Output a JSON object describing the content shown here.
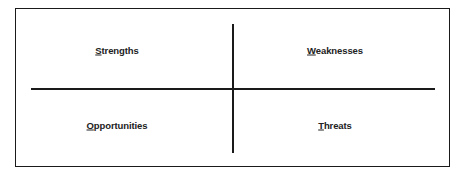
{
  "diagram": {
    "type": "SWOT matrix",
    "quadrants": [
      {
        "id": "strengths",
        "first": "S",
        "rest": "trengths",
        "label": "Strengths"
      },
      {
        "id": "weaknesses",
        "first": "W",
        "rest": "eaknesses",
        "label": "Weaknesses"
      },
      {
        "id": "opportunities",
        "first": "O",
        "rest": "pportunities",
        "label": "Opportunities"
      },
      {
        "id": "threats",
        "first": "T",
        "rest": "hreats",
        "label": "Threats"
      }
    ],
    "colors": {
      "line": "#1a1a1a",
      "text": "#222222",
      "background": "#ffffff"
    }
  }
}
